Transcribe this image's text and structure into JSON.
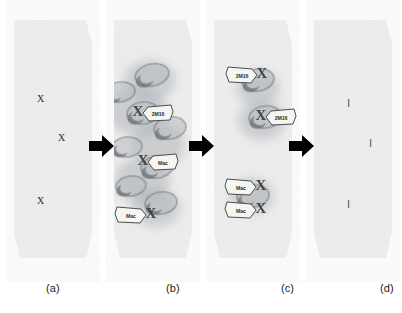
{
  "figure": {
    "background_color": "#ffffff",
    "panel_fill": "#ececec",
    "panel_fill_light": "#eeeeee",
    "arrow_color": "#000000",
    "cell_outline_color": "#6b6f74",
    "cell_fill_color": "#b9bcc0",
    "stain_color": "#9aa0a6",
    "callout_fill": "#f5f5f2",
    "callout_stroke": "#3a3a3c",
    "x_mark_color": "#2b2b2b",
    "tick_mark_color": "#55565a"
  },
  "panels": [
    {
      "id": "a",
      "caption": "(a)",
      "caption_x": 46,
      "caption_y": 288,
      "marks": [
        {
          "symbol": "X",
          "x": 37,
          "y": 94
        },
        {
          "symbol": "X",
          "x": 58,
          "y": 133
        },
        {
          "symbol": "X",
          "x": 37,
          "y": 196
        }
      ],
      "cells": [],
      "callouts": []
    },
    {
      "id": "b",
      "caption": "(b)",
      "caption_x": 166,
      "caption_y": 288,
      "marks": [],
      "cells": [
        {
          "cx": 152,
          "cy": 75,
          "rx": 17,
          "ry": 11,
          "rot": -12
        },
        {
          "cx": 120,
          "cy": 92,
          "rx": 15,
          "ry": 10,
          "rot": -8
        },
        {
          "cx": 143,
          "cy": 113,
          "rx": 16,
          "ry": 11,
          "rot": -6
        },
        {
          "cx": 170,
          "cy": 128,
          "rx": 16,
          "ry": 11,
          "rot": -10
        },
        {
          "cx": 127,
          "cy": 147,
          "rx": 15,
          "ry": 10,
          "rot": -5
        },
        {
          "cx": 157,
          "cy": 167,
          "rx": 16,
          "ry": 11,
          "rot": -8
        },
        {
          "cx": 131,
          "cy": 186,
          "rx": 15,
          "ry": 10,
          "rot": -6
        },
        {
          "cx": 161,
          "cy": 203,
          "rx": 16,
          "ry": 11,
          "rot": -9
        }
      ],
      "callouts": [
        {
          "label": "2M16",
          "x": 145,
          "y": 106,
          "tail": "left"
        },
        {
          "label": "Mac",
          "x": 150,
          "y": 155,
          "tail": "left"
        },
        {
          "label": "Mac",
          "x": 118,
          "y": 208,
          "tail": "right"
        }
      ]
    },
    {
      "id": "c",
      "caption": "(c)",
      "caption_x": 281,
      "caption_y": 288,
      "marks": [],
      "cells": [
        {
          "cx": 258,
          "cy": 80,
          "rx": 16,
          "ry": 11,
          "rot": -10
        },
        {
          "cx": 265,
          "cy": 117,
          "rx": 16,
          "ry": 11,
          "rot": -8
        },
        {
          "cx": 253,
          "cy": 196,
          "rx": 16,
          "ry": 11,
          "rot": -7
        }
      ],
      "callouts": [
        {
          "label": "2M16",
          "x": 229,
          "y": 68,
          "tail": "right"
        },
        {
          "label": "2M16",
          "x": 268,
          "y": 110,
          "tail": "left"
        },
        {
          "label": "Mac",
          "x": 228,
          "y": 180,
          "tail": "right"
        },
        {
          "label": "Mac",
          "x": 228,
          "y": 203,
          "tail": "right"
        }
      ]
    },
    {
      "id": "d",
      "caption": "(d)",
      "caption_x": 380,
      "caption_y": 288,
      "marks": [
        {
          "symbol": "I",
          "x": 347,
          "y": 98
        },
        {
          "symbol": "I",
          "x": 369,
          "y": 138
        },
        {
          "symbol": "I",
          "x": 347,
          "y": 199
        }
      ],
      "cells": [],
      "callouts": []
    }
  ],
  "arrows": [
    {
      "id": "arrow-a-to-b",
      "x": 89,
      "y": 146
    },
    {
      "id": "arrow-b-to-c",
      "x": 189,
      "y": 146
    },
    {
      "id": "arrow-c-to-d",
      "x": 289,
      "y": 146
    }
  ]
}
